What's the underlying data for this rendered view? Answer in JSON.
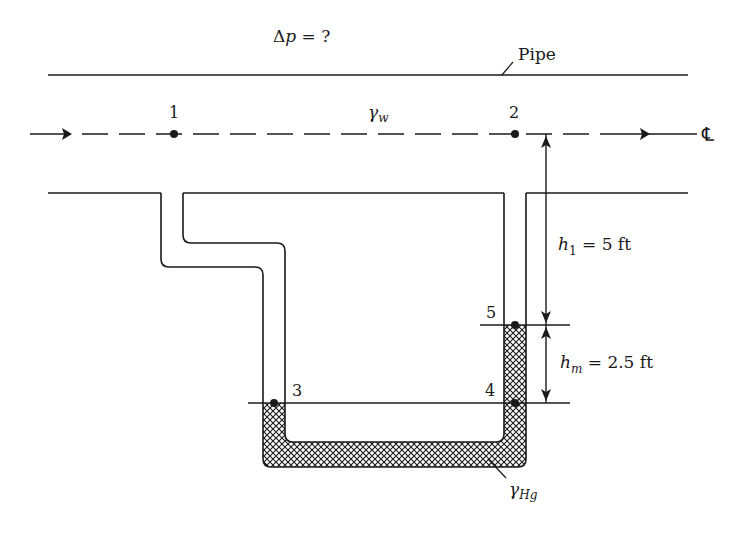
{
  "diagram": {
    "title_label": "Δp = ?",
    "title_delta": "Δ",
    "title_p": "p",
    "title_rest": " = ?",
    "pipe_label": "Pipe",
    "fluid_pipe": {
      "symbol": "γ",
      "subscript": "w"
    },
    "fluid_manometer": {
      "symbol": "γ",
      "subscript": "Hg"
    },
    "centerline_symbol": "℄",
    "points": [
      {
        "id": "1",
        "label": "1"
      },
      {
        "id": "2",
        "label": "2"
      },
      {
        "id": "3",
        "label": "3"
      },
      {
        "id": "4",
        "label": "4"
      },
      {
        "id": "5",
        "label": "5"
      }
    ],
    "dimensions": [
      {
        "name": "h1",
        "var": "h",
        "subscript": "1",
        "value": " = 5 ft"
      },
      {
        "name": "hm",
        "var": "h",
        "subscript": "m",
        "value": " = 2.5 ft"
      }
    ],
    "colors": {
      "line": "#1a1a1a",
      "background": "#ffffff"
    }
  }
}
